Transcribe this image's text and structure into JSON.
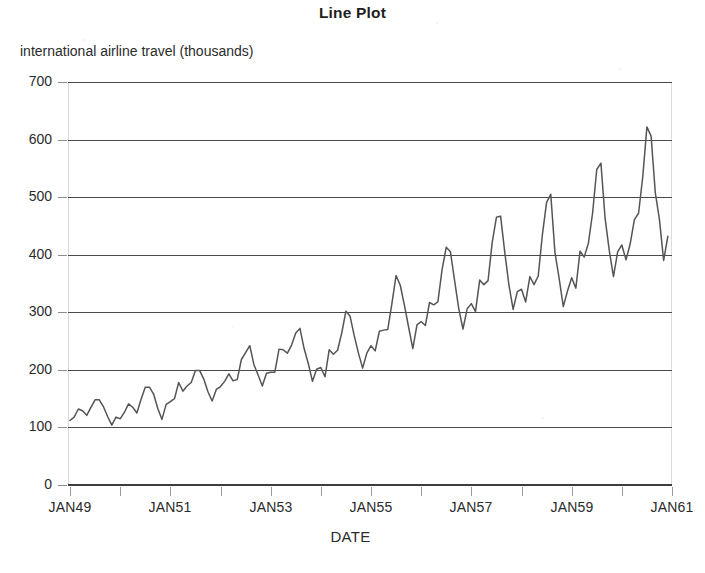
{
  "chart_data": {
    "type": "line",
    "title": "Line Plot",
    "ylabel": "international airline travel (thousands)",
    "xlabel": "DATE",
    "grid": "horizontal-only",
    "legend": "none",
    "line_color": "#555555",
    "grid_color": "#4a4a4a",
    "background_color": "#ffffff",
    "ylim": [
      0,
      700
    ],
    "ytick_labels": [
      "0",
      "100",
      "200",
      "300",
      "400",
      "500",
      "600",
      "700"
    ],
    "ytick_values": [
      0,
      100,
      200,
      300,
      400,
      500,
      600,
      700
    ],
    "xtick_labels": [
      "JAN49",
      "JAN51",
      "JAN53",
      "JAN55",
      "JAN57",
      "JAN59",
      "JAN61"
    ],
    "xtick_values": [
      "1949-01",
      "1951-01",
      "1953-01",
      "1955-01",
      "1957-01",
      "1959-01",
      "1961-01"
    ],
    "xtick_minor_labels": [
      "JAN50",
      "JAN52",
      "JAN54",
      "JAN56",
      "JAN58",
      "JAN60"
    ],
    "xlim": [
      "1949-01",
      "1961-01"
    ],
    "x": [
      "1949-01",
      "1949-02",
      "1949-03",
      "1949-04",
      "1949-05",
      "1949-06",
      "1949-07",
      "1949-08",
      "1949-09",
      "1949-10",
      "1949-11",
      "1949-12",
      "1950-01",
      "1950-02",
      "1950-03",
      "1950-04",
      "1950-05",
      "1950-06",
      "1950-07",
      "1950-08",
      "1950-09",
      "1950-10",
      "1950-11",
      "1950-12",
      "1951-01",
      "1951-02",
      "1951-03",
      "1951-04",
      "1951-05",
      "1951-06",
      "1951-07",
      "1951-08",
      "1951-09",
      "1951-10",
      "1951-11",
      "1951-12",
      "1952-01",
      "1952-02",
      "1952-03",
      "1952-04",
      "1952-05",
      "1952-06",
      "1952-07",
      "1952-08",
      "1952-09",
      "1952-10",
      "1952-11",
      "1952-12",
      "1953-01",
      "1953-02",
      "1953-03",
      "1953-04",
      "1953-05",
      "1953-06",
      "1953-07",
      "1953-08",
      "1953-09",
      "1953-10",
      "1953-11",
      "1953-12",
      "1954-01",
      "1954-02",
      "1954-03",
      "1954-04",
      "1954-05",
      "1954-06",
      "1954-07",
      "1954-08",
      "1954-09",
      "1954-10",
      "1954-11",
      "1954-12",
      "1955-01",
      "1955-02",
      "1955-03",
      "1955-04",
      "1955-05",
      "1955-06",
      "1955-07",
      "1955-08",
      "1955-09",
      "1955-10",
      "1955-11",
      "1955-12",
      "1956-01",
      "1956-02",
      "1956-03",
      "1956-04",
      "1956-05",
      "1956-06",
      "1956-07",
      "1956-08",
      "1956-09",
      "1956-10",
      "1956-11",
      "1956-12",
      "1957-01",
      "1957-02",
      "1957-03",
      "1957-04",
      "1957-05",
      "1957-06",
      "1957-07",
      "1957-08",
      "1957-09",
      "1957-10",
      "1957-11",
      "1957-12",
      "1958-01",
      "1958-02",
      "1958-03",
      "1958-04",
      "1958-05",
      "1958-06",
      "1958-07",
      "1958-08",
      "1958-09",
      "1958-10",
      "1958-11",
      "1958-12",
      "1959-01",
      "1959-02",
      "1959-03",
      "1959-04",
      "1959-05",
      "1959-06",
      "1959-07",
      "1959-08",
      "1959-09",
      "1959-10",
      "1959-11",
      "1959-12",
      "1960-01",
      "1960-02",
      "1960-03",
      "1960-04",
      "1960-05",
      "1960-06",
      "1960-07",
      "1960-08",
      "1960-09",
      "1960-10",
      "1960-11",
      "1960-12"
    ],
    "values": [
      112,
      118,
      132,
      129,
      121,
      135,
      148,
      148,
      136,
      119,
      104,
      118,
      115,
      126,
      141,
      135,
      125,
      149,
      170,
      170,
      158,
      133,
      114,
      140,
      145,
      150,
      178,
      163,
      172,
      178,
      199,
      199,
      184,
      162,
      146,
      166,
      171,
      180,
      193,
      181,
      183,
      218,
      230,
      242,
      209,
      191,
      172,
      194,
      196,
      196,
      236,
      235,
      229,
      243,
      264,
      272,
      237,
      211,
      180,
      201,
      204,
      188,
      235,
      227,
      234,
      264,
      302,
      293,
      259,
      229,
      203,
      229,
      242,
      233,
      267,
      269,
      270,
      315,
      364,
      347,
      312,
      274,
      237,
      278,
      284,
      277,
      317,
      313,
      318,
      374,
      413,
      405,
      355,
      306,
      271,
      306,
      315,
      301,
      356,
      348,
      355,
      422,
      465,
      467,
      404,
      347,
      305,
      336,
      340,
      318,
      362,
      348,
      363,
      435,
      491,
      505,
      404,
      359,
      310,
      337,
      360,
      342,
      406,
      396,
      420,
      472,
      548,
      559,
      463,
      407,
      362,
      405,
      417,
      391,
      419,
      461,
      472,
      535,
      622,
      606,
      508,
      461,
      390,
      432
    ],
    "series_name": "international airline travel (thousands)",
    "n_points": 144,
    "y_min": 104,
    "y_max": 622
  },
  "axis": {
    "ytick_labels": [
      "700",
      "600",
      "500",
      "400",
      "300",
      "200",
      "100",
      "0"
    ],
    "xtick_labels": [
      "JAN49",
      "JAN51",
      "JAN53",
      "JAN55",
      "JAN57",
      "JAN59",
      "JAN61"
    ]
  }
}
